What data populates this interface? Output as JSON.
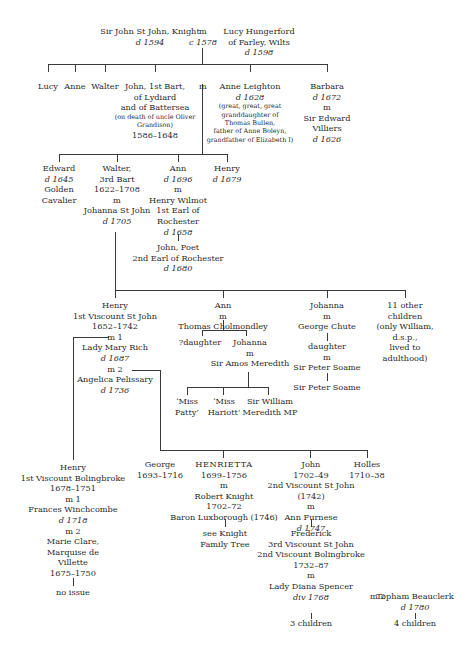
{
  "gen1": {
    "sir_john": {
      "name": "Sir John St John, Knight",
      "dates": "d 1594"
    },
    "marriage": {
      "m": "m",
      "date": "c 1578"
    },
    "lucy_h": {
      "name": "Lucy Hungerford",
      "place": "of Farley, Wilts",
      "dates": "d 1598"
    }
  },
  "gen2": {
    "lucy": "Lucy",
    "anne": "Anne",
    "walter": "Walter",
    "john": {
      "l1": "John, 1st Bart,",
      "l2": "of Lydiard",
      "l3": "and of Battersea",
      "note1": "(on death of uncle Oliver",
      "note2": "Grandison)",
      "dates": "1586–1648"
    },
    "m": "m",
    "anne_leighton": {
      "name": "Anne Leighton",
      "dates": "d 1628",
      "n1": "(great, great, great",
      "n2": "granddaughter of",
      "n3": "Thomas Bullen,",
      "n4": "father of Anne Boleyn,",
      "n5": "grandfather of Elizabeth I)"
    },
    "barbara": {
      "name": "Barbara",
      "dates": "d 1672",
      "m": "m",
      "sp1": "Sir Edward",
      "sp2": "Villiers",
      "sp_dates": "d 1626"
    }
  },
  "gen3": {
    "edward": {
      "name": "Edward",
      "dates": "d 1645",
      "l2": "Golden",
      "l3": "Cavalier"
    },
    "walter": {
      "name": "Walter,",
      "l2": "3rd Bart",
      "dates": "1622–1708",
      "m": "m",
      "spouse": "Johanna St John",
      "sp_dates": "d 1705"
    },
    "ann": {
      "name": "Ann",
      "dates": "d 1696",
      "m": "m",
      "sp1": "Henry Wilmot",
      "sp2": "1st Earl of",
      "sp3": "Rochester",
      "sp_dates": "d 1658",
      "child1": "John, Poet",
      "child2": "2nd Earl of Rochester",
      "child_dates": "d 1680"
    },
    "henry": {
      "name": "Henry",
      "dates": "d 1679"
    }
  },
  "gen4": {
    "henry": {
      "name": "Henry",
      "title": "1st Viscount St John",
      "dates": "1652–1742",
      "m1": "m 1",
      "sp1": "Lady Mary Rich",
      "sp1_dates": "d 1687",
      "m2": "m  2",
      "sp2": "Angelica Pelissary",
      "sp2_dates": "d 1736"
    },
    "ann": {
      "name": "Ann",
      "m": "m",
      "spouse": "Thomas Cholmondley",
      "c1": "?daughter",
      "c2": "Johanna",
      "c2_m": "m",
      "c2_spouse": "Sir Amos Meredith",
      "gc1a": "‘Miss",
      "gc1b": "Patty’",
      "gc2a": "‘Miss",
      "gc2b": "Hariott’",
      "gc3a": "Sir William",
      "gc3b": "Meredith MP"
    },
    "johanna": {
      "name": "Johanna",
      "m": "m",
      "spouse": "George Chute",
      "c1": "daughter",
      "c1_m": "m",
      "c1_spouse": "Sir Peter Soame",
      "gc1": "Sir Peter Soame"
    },
    "others": {
      "l1": "11 other",
      "l2": "children",
      "l3": "(only William,",
      "l4": "d.s.p.,",
      "l5": "lived to",
      "l6": "adulthood)"
    }
  },
  "gen5": {
    "henry_b": {
      "name": "Henry",
      "title": "1st Viscount Bolingbroke",
      "dates": "1678–1751",
      "m1": "m 1",
      "sp1": "Frances Winchcombe",
      "sp1_dates": "d 1718",
      "m2": "m 2",
      "sp2a": "Marie Clare,",
      "sp2b": "Marquise de",
      "sp2c": "Villette",
      "sp2_dates": "1675–1750",
      "issue": "no issue"
    },
    "george": {
      "name": "George",
      "dates": "1693–1716"
    },
    "henrietta": {
      "name": "HENRIETTA",
      "dates": "1699–1756",
      "m": "m",
      "spouse": "Robert Knight",
      "sp_dates": "1702–72",
      "sp_title": "Baron Luxborough (1746)",
      "see1": "see Knight",
      "see2": "Family Tree"
    },
    "john": {
      "name": "John",
      "dates": "1702–49",
      "title": "2nd Viscount St John",
      "title_date": "(1742)",
      "m": "m",
      "spouse": "Ann Furnese",
      "sp_dates": "d 1747",
      "c_name": "Frederick",
      "c_t1": "3rd Viscount St John",
      "c_t2": "2nd Viscount Bolingbroke",
      "c_dates": "1732–87",
      "c_m": "m",
      "c_spouse": "Lady Diana Spencer",
      "c_sp_div": "div 1768",
      "c_children": "3 children",
      "m2": "m 2",
      "sp2": "Topham Beauclerk",
      "sp2_dates": "d 1780",
      "sp2_children": "4 children"
    },
    "holles": {
      "name": "Holles",
      "dates": "1710–38"
    }
  }
}
